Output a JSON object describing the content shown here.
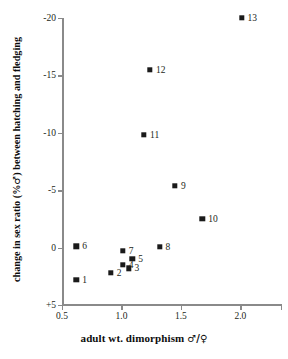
{
  "chart_data": {
    "type": "scatter",
    "title": "",
    "xlabel": "adult wt. dimorphism ♂/♀",
    "ylabel": "change in sex ratio (% ♂ ) between hatching and fledging",
    "xlim": [
      0.5,
      2.35
    ],
    "ylim": [
      -20,
      5
    ],
    "y_inverted": true,
    "grid": false,
    "legend": "none",
    "xticks": [
      "0.5",
      "1.0",
      "1.5",
      "2.0"
    ],
    "xtick_values": [
      0.5,
      1.0,
      1.5,
      2.0
    ],
    "yticks": [
      "-20",
      "-15",
      "-10",
      "-5",
      "0",
      "+5"
    ],
    "ytick_values": [
      -20,
      -15,
      -10,
      -5,
      0,
      5
    ],
    "marker": "filled-square",
    "marker_color": "#1a1a1a",
    "points": [
      {
        "label": "1",
        "x": 0.62,
        "y": 2.8,
        "lx": 6,
        "ly": -5
      },
      {
        "label": "2",
        "x": 0.91,
        "y": 2.2,
        "lx": 6,
        "ly": -5
      },
      {
        "label": "3",
        "x": 1.06,
        "y": 1.8,
        "lx": 6,
        "ly": -5
      },
      {
        "label": "4",
        "x": 1.01,
        "y": 1.5,
        "lx": 6,
        "ly": -5
      },
      {
        "label": "5",
        "x": 1.09,
        "y": 1.0,
        "lx": 6,
        "ly": -5
      },
      {
        "label": "6",
        "x": 0.62,
        "y": -0.1,
        "lx": 6,
        "ly": -5
      },
      {
        "label": "7",
        "x": 1.01,
        "y": 0.3,
        "lx": 6,
        "ly": -5
      },
      {
        "label": "8",
        "x": 1.32,
        "y": -0.05,
        "lx": 6,
        "ly": -5
      },
      {
        "label": "9",
        "x": 1.45,
        "y": -5.4,
        "lx": 6,
        "ly": -5
      },
      {
        "label": "10",
        "x": 1.68,
        "y": -2.5,
        "lx": 6,
        "ly": -5
      },
      {
        "label": "11",
        "x": 1.19,
        "y": -9.8,
        "lx": 6,
        "ly": -5
      },
      {
        "label": "12",
        "x": 1.24,
        "y": -15.5,
        "lx": 6,
        "ly": -5
      },
      {
        "label": "13",
        "x": 2.01,
        "y": -20.0,
        "lx": 6,
        "ly": -5
      }
    ]
  },
  "axes": {
    "x_title": "adult wt. dimorphism",
    "x_title_symbol": "♂/♀",
    "y_title_part1": "change in sex ratio (%",
    "y_title_symbol": "♂",
    "y_title_part2": ") between hatching and fledging"
  },
  "colors": {
    "marker": "#1a1a1a",
    "axis": "#8a8a8a",
    "text": "#231f20",
    "title_text": "#0d0d0d",
    "background": "#ffffff"
  }
}
